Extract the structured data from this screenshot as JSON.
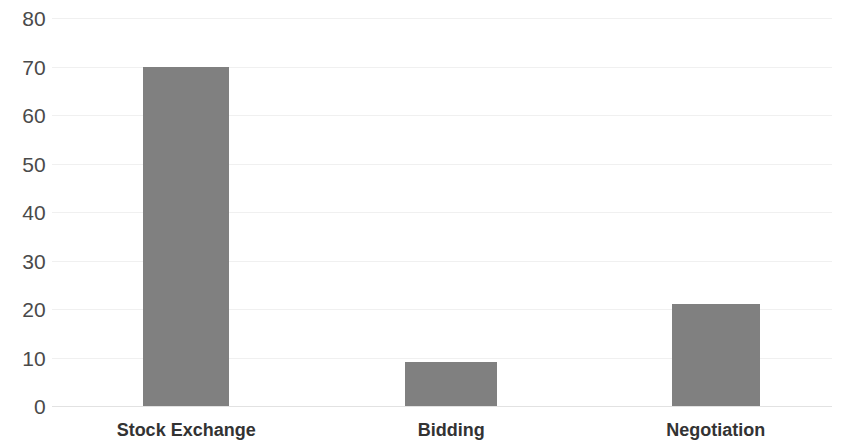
{
  "chart_data": {
    "type": "bar",
    "title": "",
    "subtitle": "",
    "xlabel": "",
    "ylabel": "",
    "categories": [
      "Stock Exchange",
      "Bidding",
      "Negotiation"
    ],
    "values": [
      70,
      9,
      21
    ],
    "series": [
      {
        "name": "",
        "values": [
          70,
          9,
          21
        ]
      }
    ],
    "ylim": [
      0,
      80
    ],
    "y_ticks": [
      0,
      10,
      20,
      30,
      40,
      50,
      60,
      70,
      80
    ],
    "y_tick_labels": [
      "0",
      "10",
      "20",
      "30",
      "40",
      "50",
      "60",
      "70",
      "80"
    ],
    "grid": true,
    "grid_axis": "y",
    "legend": false,
    "legend_position": "none",
    "annotations": [],
    "colors": {
      "bar_fill": "#808080",
      "gridline": "#f0f0f0",
      "axis_line": "#e2e2e2",
      "tick_label": "#4a4a4a",
      "category_label": "#333333",
      "background": "#ffffff"
    },
    "bar_geometry": [
      {
        "category": "Stock Exchange",
        "value": 70,
        "left_pct": 11.7,
        "width_pct": 11.0,
        "center_pct": 17.2
      },
      {
        "category": "Bidding",
        "value": 9,
        "left_pct": 45.3,
        "width_pct": 11.8,
        "center_pct": 51.2
      },
      {
        "category": "Negotiation",
        "value": 21,
        "left_pct": 79.5,
        "width_pct": 11.3,
        "center_pct": 85.1
      }
    ]
  }
}
